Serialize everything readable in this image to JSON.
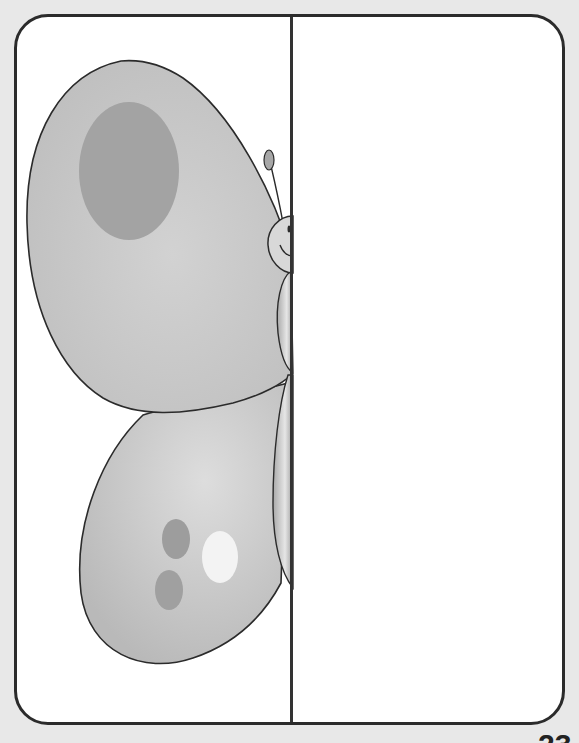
{
  "worksheet": {
    "activity": "symmetry drawing – half butterfly",
    "left_half": "butterfly half with wings, spots, body, antenna and smiling face",
    "right_half": "blank drawing area"
  },
  "colors": {
    "background": "#e8e8e8",
    "frame_fill": "#ffffff",
    "outline": "#2b2b2b",
    "wing_fill": "#c4c4c4",
    "wing_light": "#dadada",
    "spot_dark": "#9a9a9a",
    "spot_light": "#f4f4f4"
  },
  "footer": {
    "page_number": "23"
  }
}
